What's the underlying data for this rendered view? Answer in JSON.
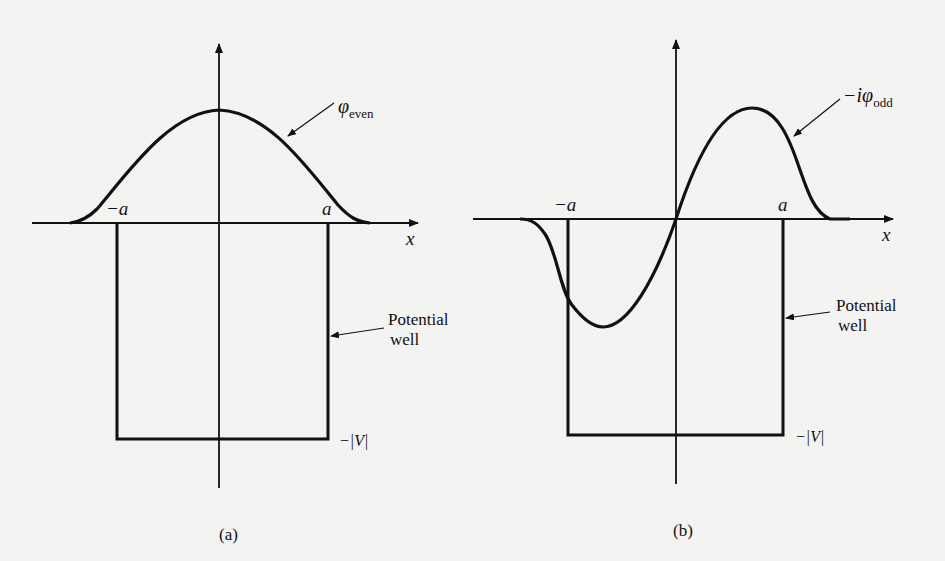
{
  "figure": {
    "background": "#f3f3f1",
    "ink": "#111111"
  },
  "panels": [
    {
      "id": "a",
      "caption": "(a)",
      "wavefunction_label": "φ",
      "wavefunction_prefix": "",
      "wavefunction_subscript": "even",
      "x_axis_label": "x",
      "left_edge_label": "−a",
      "right_edge_label": "a",
      "well_label_line1": "Potential",
      "well_label_line2": "well",
      "well_depth_label": "−|V|"
    },
    {
      "id": "b",
      "caption": "(b)",
      "wavefunction_label": "φ",
      "wavefunction_prefix": "−i",
      "wavefunction_subscript": "odd",
      "x_axis_label": "x",
      "left_edge_label": "−a",
      "right_edge_label": "a",
      "well_label_line1": "Potential",
      "well_label_line2": "well",
      "well_depth_label": "−|V|"
    }
  ]
}
